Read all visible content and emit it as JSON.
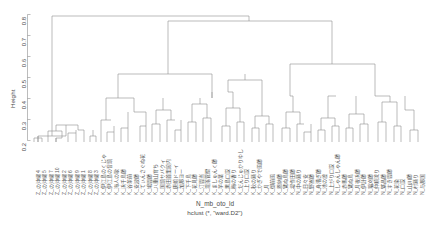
{
  "plot": {
    "type": "dendrogram",
    "xlabel": "N_mb_oto_ld",
    "subtitle": "hclust (*, \"ward.D2\")",
    "yaxis": {
      "title": "Height",
      "ticks": [
        "0.2",
        "0.3",
        "0.4",
        "0.5",
        "0.6",
        "0.7",
        "0.8"
      ],
      "min": 0.2,
      "max": 0.8
    },
    "linkage": "ward.D2",
    "stroke_color": "#8e8e8e",
    "text_color": "#4a4a4a",
    "background": "#ffffff"
  },
  "chart_data": {
    "type": "dendrogram",
    "title": "",
    "xlabel": "N_mb_oto_ld",
    "subtitle": "hclust (*, \"ward.D2\")",
    "ylabel": "Height",
    "ylim": [
      0.2,
      0.8
    ],
    "yticks": [
      0.2,
      0.3,
      0.4,
      0.5,
      0.6,
      0.7,
      0.8
    ],
    "grid": false,
    "legend": "none",
    "n_leaves": 60,
    "root_height": 0.8,
    "leaf_labels": [
      "Z_の沖縄 4",
      "Z_の沖縄 5",
      "Z_の沖縄 7",
      "Z_の沖縄 10",
      "Z_の沖縄 2",
      "Z_の沖縄 6",
      "Z_の沖縄 9",
      "Z_の沖縄 1",
      "Z_の沖縄 8",
      "Z_の沖縄 3",
      "K_伊江島のくじゃ",
      "K_伊江島の音頭",
      "K_海人の歌",
      "K_浜千鳥節",
      "K_谷茶前",
      "K_安波節",
      "K_てぃんさぐぬ花",
      "K_鳩間節",
      "K_八重山育ち",
      "K_国頭サバクイ",
      "K_赤田首里殿内",
      "K_唐船ドーイ",
      "K_加那ヨー",
      "K_下千鳥",
      "K_花見節",
      "K_汀間当",
      "K_瀧落菅撹",
      "K_ましゅんく節",
      "K_芋の葉",
      "K_黒島口説",
      "K_梅の香り",
      "K_だんじゅかりゆし",
      "K_上り口説",
      "K_秋の踊り",
      "K_かぎやで風節",
      "K_月",
      "K_御前風",
      "K_恩納節",
      "K_鷲ぬ鳥節",
      "K_揚作田節",
      "N_中の踊り",
      "N_日々安",
      "N_野嵩節",
      "N_舟漕ぎ節",
      "N_池の渡",
      "N_上がり口説",
      "N_しゃんしゃん節",
      "N_赤馬節",
      "N_鷲ぬ鳥",
      "N_月夜浜節",
      "N_伊計節",
      "N_稲刈節",
      "N_仲順流り",
      "N_繁昌節",
      "N_すき間節",
      "N_花染",
      "N_口説",
      "N_山川節",
      "N_村踊り",
      "N_与那国"
    ],
    "group_prefixes": [
      "Z_",
      "K_",
      "N_"
    ],
    "merge_heights_top": [
      0.8,
      0.77,
      0.485,
      0.555,
      0.4,
      0.395,
      0.325,
      0.33
    ]
  }
}
